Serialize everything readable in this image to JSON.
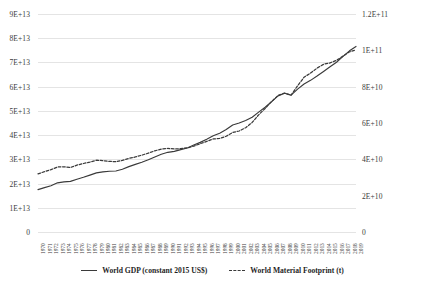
{
  "chart_data": {
    "type": "line",
    "title": "",
    "xlabel": "",
    "grid": true,
    "legend_position": "bottom",
    "x": [
      1970,
      1971,
      1972,
      1973,
      1974,
      1975,
      1976,
      1977,
      1978,
      1979,
      1980,
      1981,
      1982,
      1983,
      1984,
      1985,
      1986,
      1987,
      1988,
      1989,
      1990,
      1991,
      1992,
      1993,
      1994,
      1995,
      1996,
      1997,
      1998,
      1999,
      2000,
      2001,
      2002,
      2003,
      2004,
      2005,
      2006,
      2007,
      2008,
      2009,
      2010,
      2011,
      2012,
      2013,
      2014,
      2015,
      2016,
      2017,
      2018,
      2019
    ],
    "axes": {
      "left": {
        "name": "World GDP (constant 2015 US$)",
        "ylim": [
          0,
          90000000000000
        ],
        "ticks": [
          0,
          10000000000000,
          20000000000000,
          30000000000000,
          40000000000000,
          50000000000000,
          60000000000000,
          70000000000000,
          80000000000000,
          90000000000000
        ],
        "tick_labels": [
          "0",
          "1E+13",
          "2E+13",
          "3E+13",
          "4E+13",
          "5E+13",
          "6E+13",
          "7E+13",
          "8E+13",
          "9E+13"
        ]
      },
      "right": {
        "name": "World Material Footprint (t)",
        "ylim": [
          0,
          120000000000
        ],
        "ticks": [
          0,
          20000000000,
          40000000000,
          60000000000,
          80000000000,
          100000000000,
          120000000000
        ],
        "tick_labels": [
          "0",
          "2E+10",
          "4E+10",
          "6E+10",
          "8E+10",
          "1E+11",
          "1.2E+11"
        ]
      }
    },
    "series": [
      {
        "name": "World GDP (constant 2015 US$)",
        "axis": "left",
        "style": "solid",
        "color": "#3a3a3a",
        "values": [
          17500000000000,
          18300000000000,
          19100000000000,
          20300000000000,
          20700000000000,
          20900000000000,
          21800000000000,
          22600000000000,
          23500000000000,
          24400000000000,
          24800000000000,
          25100000000000,
          25200000000000,
          25900000000000,
          27000000000000,
          27900000000000,
          28800000000000,
          29800000000000,
          31000000000000,
          32100000000000,
          32900000000000,
          33300000000000,
          34000000000000,
          34700000000000,
          35900000000000,
          37000000000000,
          38300000000000,
          39700000000000,
          40800000000000,
          42300000000000,
          44200000000000,
          45000000000000,
          46000000000000,
          47400000000000,
          49500000000000,
          51500000000000,
          53800000000000,
          56200000000000,
          57300000000000,
          56500000000000,
          59000000000000,
          61100000000000,
          62600000000000,
          64400000000000,
          66300000000000,
          68200000000000,
          70100000000000,
          72500000000000,
          74800000000000,
          76600000000000
        ]
      },
      {
        "name": "World Material Footprint (t)",
        "axis": "right",
        "style": "dashed",
        "color": "#3a3a3a",
        "values": [
          32000000000,
          33200000000,
          34300000000,
          35800000000,
          35900000000,
          35500000000,
          36800000000,
          37700000000,
          38500000000,
          39500000000,
          39300000000,
          38900000000,
          38700000000,
          39400000000,
          40500000000,
          41300000000,
          42300000000,
          43400000000,
          44700000000,
          45600000000,
          46000000000,
          45700000000,
          45900000000,
          46300000000,
          47300000000,
          48600000000,
          49900000000,
          51200000000,
          51500000000,
          52700000000,
          54800000000,
          55600000000,
          57400000000,
          60300000000,
          64500000000,
          68000000000,
          71800000000,
          75200000000,
          76500000000,
          75300000000,
          80500000000,
          85200000000,
          87500000000,
          90200000000,
          92300000000,
          93100000000,
          94500000000,
          96800000000,
          99200000000,
          100300000000
        ]
      }
    ]
  },
  "legend": {
    "items": [
      {
        "label": "World GDP (constant 2015 US$)",
        "style": "solid"
      },
      {
        "label": "World Material Footprint (t)",
        "style": "dashed"
      }
    ]
  }
}
